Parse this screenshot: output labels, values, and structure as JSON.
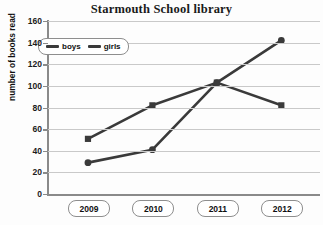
{
  "chart_data": {
    "type": "line",
    "title": "Starmouth School library",
    "xlabel": "",
    "ylabel": "number of books read",
    "categories": [
      "2009",
      "2010",
      "2011",
      "2012"
    ],
    "series": [
      {
        "name": "boys",
        "values": [
          51,
          82,
          103,
          82
        ],
        "color": "#3a3a3a",
        "marker": "square"
      },
      {
        "name": "girls",
        "values": [
          29,
          41,
          103,
          142
        ],
        "color": "#3a3a3a",
        "marker": "circle"
      }
    ],
    "ylim": [
      0,
      160
    ],
    "yticks": [
      0,
      20,
      40,
      60,
      80,
      100,
      120,
      140,
      160
    ],
    "ytick_labels": [
      "0",
      "20",
      "40",
      "60",
      "80",
      "100",
      "120",
      "140",
      "160"
    ],
    "grid": true,
    "legend_position": "top-left"
  }
}
